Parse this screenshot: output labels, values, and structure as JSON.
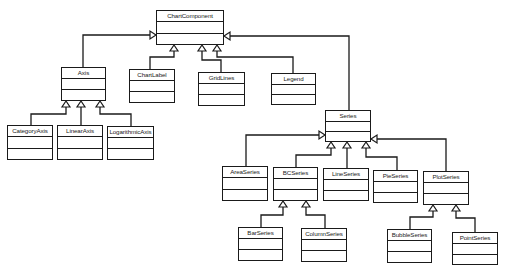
{
  "diagram": {
    "type": "uml-class-diagram",
    "classes": [
      {
        "id": "ChartComponent",
        "name": "ChartComponent",
        "x": 156,
        "y": 10,
        "w": 68,
        "h": 35
      },
      {
        "id": "Axis",
        "name": "Axis",
        "x": 61,
        "y": 67,
        "w": 45,
        "h": 34
      },
      {
        "id": "ChartLabel",
        "name": "ChartLabel",
        "x": 129,
        "y": 69,
        "w": 46,
        "h": 34
      },
      {
        "id": "GridLines",
        "name": "GridLines",
        "x": 198,
        "y": 72,
        "w": 47,
        "h": 34
      },
      {
        "id": "Legend",
        "name": "Legend",
        "x": 271,
        "y": 73,
        "w": 45,
        "h": 32
      },
      {
        "id": "CategoryAxis",
        "name": "CategoryAxis",
        "x": 7,
        "y": 125,
        "w": 46,
        "h": 35
      },
      {
        "id": "LinearAxis",
        "name": "LinearAxis",
        "x": 57,
        "y": 125,
        "w": 46,
        "h": 35
      },
      {
        "id": "LogarithmicAxis",
        "name": "LogarithmicAxis",
        "x": 107,
        "y": 126,
        "w": 47,
        "h": 34
      },
      {
        "id": "Series",
        "name": "Series",
        "x": 325,
        "y": 110,
        "w": 46,
        "h": 32
      },
      {
        "id": "AreaSeries",
        "name": "AreaSeries",
        "x": 222,
        "y": 166,
        "w": 46,
        "h": 35
      },
      {
        "id": "BCSeries",
        "name": "BCSeries",
        "x": 273,
        "y": 167,
        "w": 45,
        "h": 34
      },
      {
        "id": "LineSeries",
        "name": "LineSeries",
        "x": 323,
        "y": 168,
        "w": 46,
        "h": 33
      },
      {
        "id": "PieSeries",
        "name": "PieSeries",
        "x": 373,
        "y": 170,
        "w": 45,
        "h": 33
      },
      {
        "id": "PlotSeries",
        "name": "PlotSeries",
        "x": 423,
        "y": 171,
        "w": 46,
        "h": 34
      },
      {
        "id": "BarSeries",
        "name": "BarSeries",
        "x": 238,
        "y": 227,
        "w": 45,
        "h": 34
      },
      {
        "id": "ColumnSeries",
        "name": "ColumnSeries",
        "x": 301,
        "y": 228,
        "w": 46,
        "h": 34
      },
      {
        "id": "BubbleSeries",
        "name": "BubbleSeries",
        "x": 387,
        "y": 229,
        "w": 45,
        "h": 34
      },
      {
        "id": "PointSeries",
        "name": "PointSeries",
        "x": 452,
        "y": 232,
        "w": 46,
        "h": 33
      }
    ],
    "generalizations": [
      {
        "child": "Axis",
        "parent": "ChartComponent"
      },
      {
        "child": "ChartLabel",
        "parent": "ChartComponent"
      },
      {
        "child": "GridLines",
        "parent": "ChartComponent"
      },
      {
        "child": "Legend",
        "parent": "ChartComponent"
      },
      {
        "child": "Series",
        "parent": "ChartComponent"
      },
      {
        "child": "CategoryAxis",
        "parent": "Axis"
      },
      {
        "child": "LinearAxis",
        "parent": "Axis"
      },
      {
        "child": "LogarithmicAxis",
        "parent": "Axis"
      },
      {
        "child": "AreaSeries",
        "parent": "Series"
      },
      {
        "child": "BCSeries",
        "parent": "Series"
      },
      {
        "child": "LineSeries",
        "parent": "Series"
      },
      {
        "child": "PieSeries",
        "parent": "Series"
      },
      {
        "child": "PlotSeries",
        "parent": "Series"
      },
      {
        "child": "BarSeries",
        "parent": "BCSeries"
      },
      {
        "child": "ColumnSeries",
        "parent": "BCSeries"
      },
      {
        "child": "BubbleSeries",
        "parent": "PlotSeries"
      },
      {
        "child": "PointSeries",
        "parent": "PlotSeries"
      }
    ],
    "edges": [
      {
        "from": "Axis",
        "points": [
          [
            83,
            67
          ],
          [
            83,
            35
          ],
          [
            152,
            35
          ]
        ],
        "arrow_dir": "right"
      },
      {
        "from": "ChartLabel",
        "points": [
          [
            150,
            69
          ],
          [
            150,
            57
          ],
          [
            174,
            57
          ],
          [
            174,
            49
          ]
        ],
        "arrow_dir": "up"
      },
      {
        "from": "GridLines",
        "points": [
          [
            221,
            72
          ],
          [
            221,
            60
          ],
          [
            202,
            60
          ],
          [
            202,
            49
          ]
        ],
        "arrow_dir": "up"
      },
      {
        "from": "Legend",
        "points": [
          [
            293,
            73
          ],
          [
            293,
            57
          ],
          [
            217,
            57
          ],
          [
            217,
            49
          ]
        ],
        "arrow_dir": "up"
      },
      {
        "from": "Series",
        "points": [
          [
            349,
            110
          ],
          [
            349,
            36
          ],
          [
            228,
            36
          ]
        ],
        "arrow_dir": "left"
      },
      {
        "from": "CategoryAxis",
        "points": [
          [
            31,
            125
          ],
          [
            31,
            114
          ],
          [
            66,
            114
          ],
          [
            66,
            105
          ]
        ],
        "arrow_dir": "up"
      },
      {
        "from": "LinearAxis",
        "points": [
          [
            81,
            125
          ],
          [
            81,
            105
          ]
        ],
        "arrow_dir": "up"
      },
      {
        "from": "LogarithmicAxis",
        "points": [
          [
            131,
            126
          ],
          [
            131,
            114
          ],
          [
            100,
            114
          ],
          [
            100,
            105
          ]
        ],
        "arrow_dir": "up"
      },
      {
        "from": "AreaSeries",
        "points": [
          [
            246,
            166
          ],
          [
            246,
            135
          ],
          [
            321,
            135
          ]
        ],
        "arrow_dir": "right"
      },
      {
        "from": "BCSeries",
        "points": [
          [
            296,
            167
          ],
          [
            296,
            155
          ],
          [
            331,
            155
          ],
          [
            331,
            146
          ]
        ],
        "arrow_dir": "up"
      },
      {
        "from": "LineSeries",
        "points": [
          [
            347,
            168
          ],
          [
            347,
            146
          ]
        ],
        "arrow_dir": "up"
      },
      {
        "from": "PieSeries",
        "points": [
          [
            397,
            170
          ],
          [
            397,
            157
          ],
          [
            366,
            157
          ],
          [
            366,
            146
          ]
        ],
        "arrow_dir": "up"
      },
      {
        "from": "PlotSeries",
        "points": [
          [
            446,
            171
          ],
          [
            446,
            139
          ],
          [
            375,
            139
          ]
        ],
        "arrow_dir": "left"
      },
      {
        "from": "BarSeries",
        "points": [
          [
            261,
            227
          ],
          [
            261,
            215
          ],
          [
            283,
            215
          ],
          [
            283,
            205
          ]
        ],
        "arrow_dir": "up"
      },
      {
        "from": "ColumnSeries",
        "points": [
          [
            325,
            228
          ],
          [
            325,
            215
          ],
          [
            306,
            215
          ],
          [
            306,
            205
          ]
        ],
        "arrow_dir": "up"
      },
      {
        "from": "BubbleSeries",
        "points": [
          [
            410,
            229
          ],
          [
            410,
            217
          ],
          [
            433,
            217
          ],
          [
            433,
            209
          ]
        ],
        "arrow_dir": "up"
      },
      {
        "from": "PointSeries",
        "points": [
          [
            475,
            232
          ],
          [
            475,
            218
          ],
          [
            456,
            218
          ],
          [
            456,
            209
          ]
        ],
        "arrow_dir": "up"
      }
    ],
    "colors": {
      "line": "#1a1a1a",
      "box_fill": "#ffffff",
      "background": "#ffffff",
      "text": "#222222"
    }
  }
}
